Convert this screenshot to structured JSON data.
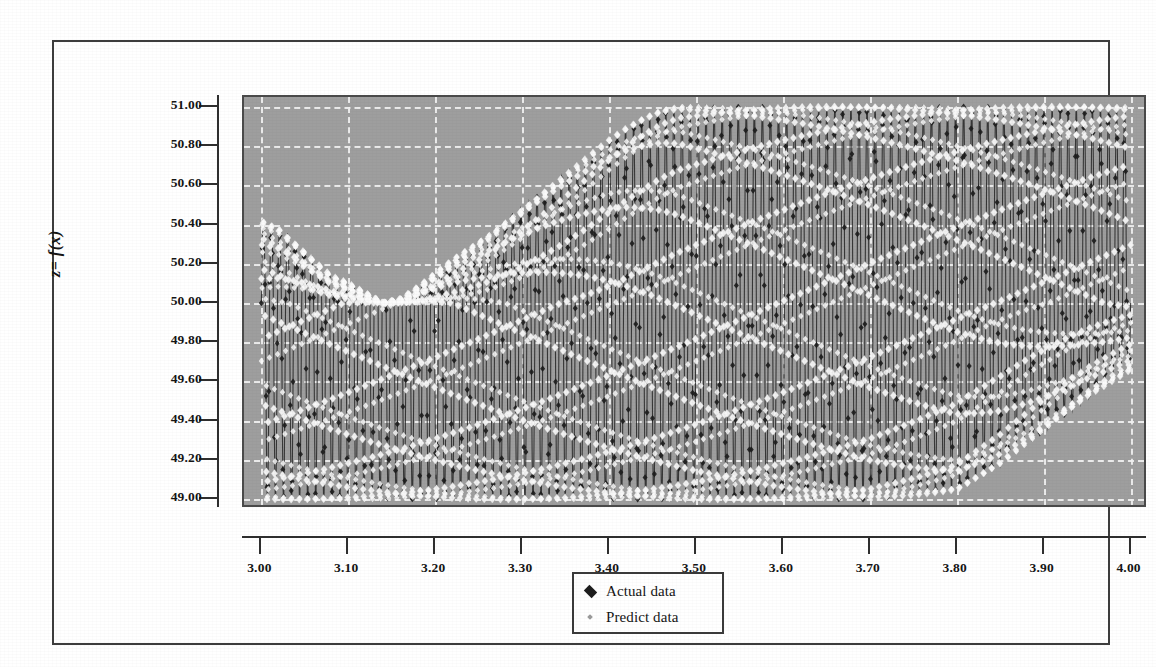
{
  "chart_data": {
    "type": "scatter",
    "title": "",
    "xlabel": "x",
    "ylabel": "z= f(x)",
    "xlim": [
      2.98,
      4.02
    ],
    "ylim": [
      48.95,
      51.05
    ],
    "xticks": [
      "3.00",
      "3.10",
      "3.20",
      "3.30",
      "3.40",
      "3.50",
      "3.60",
      "3.70",
      "3.80",
      "3.90",
      "4.00"
    ],
    "xtick_values": [
      3.0,
      3.1,
      3.2,
      3.3,
      3.4,
      3.5,
      3.6,
      3.7,
      3.8,
      3.9,
      4.0
    ],
    "yticks": [
      "49.00",
      "49.20",
      "49.40",
      "49.60",
      "49.80",
      "50.00",
      "50.20",
      "50.40",
      "50.60",
      "50.80",
      "51.00"
    ],
    "ytick_values": [
      49.0,
      49.2,
      49.4,
      49.6,
      49.8,
      50.0,
      50.2,
      50.4,
      50.6,
      50.8,
      51.0
    ],
    "grid": true,
    "grid_color": "#f2f2f2",
    "plot_background": "#9e9e9e",
    "legend_position": "bottom-center",
    "legend": [
      "Actual data",
      "Predict data"
    ],
    "series": [
      {
        "name": "Actual data",
        "marker": "diamond",
        "color": "#1d1d1d",
        "line": true,
        "description": "high-frequency oscillation, dark markers joined by thin line"
      },
      {
        "name": "Predict data",
        "marker": "diamond",
        "color": "#f4f4f4",
        "line": false,
        "description": "high-frequency oscillation, light/white diamond markers overlaying actual data"
      }
    ],
    "envelope": {
      "description": "amplitude-modulated oscillation about a centre near 50.00; values clipped by the 49.00-51.00 axis range",
      "x": [
        3.0,
        3.02,
        3.04,
        3.06,
        3.08,
        3.1,
        3.12,
        3.14,
        3.16,
        3.18,
        3.2,
        3.22,
        3.24,
        3.26,
        3.28,
        3.3,
        3.32,
        3.34,
        3.36,
        3.38,
        3.4,
        3.42,
        3.44,
        3.46,
        3.48,
        3.5,
        3.55,
        3.6,
        3.65,
        3.7,
        3.75,
        3.8,
        3.85,
        3.9,
        3.95,
        4.0
      ],
      "upper": [
        50.42,
        50.38,
        50.3,
        50.22,
        50.14,
        50.1,
        50.05,
        50.0,
        50.02,
        50.08,
        50.15,
        50.22,
        50.28,
        50.34,
        50.41,
        50.48,
        50.55,
        50.62,
        50.69,
        50.76,
        50.83,
        50.89,
        50.94,
        50.98,
        51.0,
        51.0,
        51.0,
        51.0,
        51.0,
        51.0,
        51.0,
        51.0,
        51.0,
        51.0,
        51.0,
        51.0
      ],
      "lower": [
        49.0,
        49.0,
        49.0,
        49.0,
        49.0,
        49.0,
        49.0,
        49.0,
        49.0,
        49.0,
        49.0,
        49.0,
        49.0,
        49.0,
        49.0,
        49.0,
        49.0,
        49.0,
        49.0,
        49.0,
        49.0,
        49.0,
        49.0,
        49.0,
        49.0,
        49.0,
        49.0,
        49.0,
        49.0,
        49.0,
        49.02,
        49.05,
        49.18,
        49.35,
        49.52,
        49.66
      ],
      "centre": 50.0,
      "points_per_x_unit": 1400
    }
  },
  "axes": {
    "y_title": "z= f(x)",
    "x_title": "x"
  },
  "legend": {
    "items": [
      {
        "label": "Actual data",
        "marker": "diamond-dark"
      },
      {
        "label": "Predict data",
        "marker": "diamond-light"
      }
    ]
  }
}
